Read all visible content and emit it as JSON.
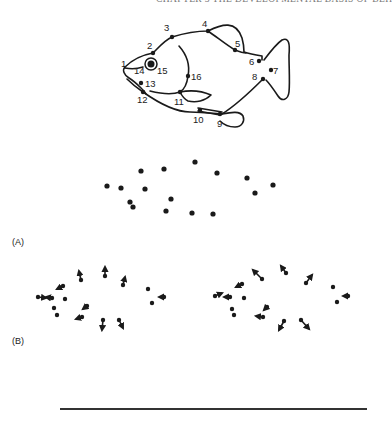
{
  "header": {
    "running_title": "CHAPTER 3  THE DEVELOPMENTAL BASIS OF BEH"
  },
  "figure": {
    "fish": {
      "landmarks": [
        {
          "n": "1",
          "x": 125,
          "y": 67,
          "lx": 121,
          "ly": 67
        },
        {
          "n": "2",
          "x": 153,
          "y": 53,
          "lx": 147,
          "ly": 49
        },
        {
          "n": "3",
          "x": 172,
          "y": 37,
          "lx": 164,
          "ly": 31
        },
        {
          "n": "4",
          "x": 208,
          "y": 31,
          "lx": 202,
          "ly": 27
        },
        {
          "n": "5",
          "x": 235,
          "y": 50,
          "lx": 235,
          "ly": 47
        },
        {
          "n": "6",
          "x": 259,
          "y": 61,
          "lx": 249,
          "ly": 65
        },
        {
          "n": "7",
          "x": 271,
          "y": 70,
          "lx": 273,
          "ly": 74
        },
        {
          "n": "8",
          "x": 263,
          "y": 79,
          "lx": 252,
          "ly": 80
        },
        {
          "n": "9",
          "x": 220,
          "y": 114,
          "lx": 217,
          "ly": 127
        },
        {
          "n": "10",
          "x": 200,
          "y": 110,
          "lx": 193,
          "ly": 123
        },
        {
          "n": "11",
          "x": 180,
          "y": 92,
          "lx": 174,
          "ly": 105
        },
        {
          "n": "12",
          "x": 143,
          "y": 92,
          "lx": 137,
          "ly": 103
        },
        {
          "n": "13",
          "x": 141,
          "y": 83,
          "lx": 145,
          "ly": 87
        },
        {
          "n": "14",
          "x": 148,
          "y": 64,
          "lx": 134,
          "ly": 74
        },
        {
          "n": "15",
          "x": 157,
          "y": 64,
          "lx": 157,
          "ly": 74
        },
        {
          "n": "16",
          "x": 188,
          "y": 76,
          "lx": 191,
          "ly": 80
        }
      ]
    },
    "panel_a": {
      "label": "(A)",
      "points": [
        [
          141,
          171
        ],
        [
          164,
          169
        ],
        [
          195,
          162
        ],
        [
          217,
          173
        ],
        [
          247,
          178
        ],
        [
          273,
          185
        ],
        [
          255,
          193
        ],
        [
          107,
          186
        ],
        [
          121,
          188
        ],
        [
          145,
          189
        ],
        [
          130,
          202
        ],
        [
          133,
          207
        ],
        [
          171,
          199
        ],
        [
          166,
          211
        ],
        [
          192,
          213
        ],
        [
          213,
          214
        ]
      ]
    },
    "panel_b": {
      "label": "(B)",
      "left": {
        "points": [
          [
            81,
            280
          ],
          [
            105,
            276
          ],
          [
            123,
            285
          ],
          [
            63,
            286
          ],
          [
            148,
            289
          ],
          [
            164,
            297
          ],
          [
            152,
            303
          ],
          [
            38,
            297
          ],
          [
            52,
            298
          ],
          [
            65,
            299
          ],
          [
            54,
            308
          ],
          [
            57,
            315
          ],
          [
            87,
            306
          ],
          [
            82,
            317
          ],
          [
            103,
            320
          ],
          [
            119,
            320
          ]
        ],
        "vectors": [
          [
            81,
            280,
            79,
            271
          ],
          [
            105,
            276,
            105,
            267
          ],
          [
            123,
            285,
            125,
            277
          ],
          [
            63,
            286,
            57,
            289
          ],
          [
            164,
            297,
            159,
            297
          ],
          [
            38,
            297,
            46,
            298
          ],
          [
            52,
            298,
            46,
            297
          ],
          [
            87,
            306,
            83,
            309
          ],
          [
            82,
            317,
            76,
            319
          ],
          [
            103,
            320,
            102,
            330
          ],
          [
            119,
            320,
            123,
            328
          ]
        ]
      },
      "right": {
        "points": [
          [
            262,
            279
          ],
          [
            286,
            273
          ],
          [
            306,
            283
          ],
          [
            242,
            284
          ],
          [
            333,
            287
          ],
          [
            348,
            296
          ],
          [
            337,
            302
          ],
          [
            215,
            296
          ],
          [
            230,
            297
          ],
          [
            244,
            298
          ],
          [
            232,
            309
          ],
          [
            234,
            315
          ],
          [
            267,
            307
          ],
          [
            263,
            317
          ],
          [
            284,
            321
          ],
          [
            301,
            320
          ]
        ],
        "vectors": [
          [
            262,
            279,
            253,
            270
          ],
          [
            286,
            273,
            281,
            266
          ],
          [
            306,
            283,
            312,
            275
          ],
          [
            242,
            284,
            236,
            287
          ],
          [
            348,
            296,
            343,
            296
          ],
          [
            215,
            296,
            222,
            293
          ],
          [
            230,
            297,
            224,
            297
          ],
          [
            267,
            307,
            264,
            310
          ],
          [
            263,
            317,
            256,
            316
          ],
          [
            284,
            321,
            279,
            330
          ],
          [
            301,
            320,
            309,
            329
          ]
        ]
      }
    }
  }
}
